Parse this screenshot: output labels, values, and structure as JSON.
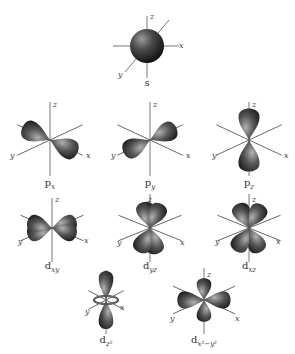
{
  "diagram": {
    "axis_labels": {
      "x": "x",
      "y": "y",
      "z": "z"
    },
    "orbitals": [
      {
        "id": "s",
        "label": "s",
        "sub": "",
        "shape": "sphere"
      },
      {
        "id": "px",
        "label": "p",
        "sub": "x",
        "shape": "dumbbell-x"
      },
      {
        "id": "py",
        "label": "p",
        "sub": "y",
        "shape": "dumbbell-y"
      },
      {
        "id": "pz",
        "label": "p",
        "sub": "z",
        "shape": "dumbbell-z"
      },
      {
        "id": "dxy",
        "label": "d",
        "sub": "xy",
        "shape": "cloverleaf-xy"
      },
      {
        "id": "dyz",
        "label": "d",
        "sub": "yz",
        "shape": "cloverleaf-yz"
      },
      {
        "id": "dxz",
        "label": "d",
        "sub": "xz",
        "shape": "cloverleaf-xz"
      },
      {
        "id": "dz2",
        "label": "d",
        "sub": "z²",
        "shape": "dumbbell-torus"
      },
      {
        "id": "dx2y2",
        "label": "d",
        "sub": "x²−y²",
        "shape": "cloverleaf-axes"
      }
    ],
    "colors": {
      "lobe_dark": "#2a2a2a",
      "lobe_light": "#9a9a9a",
      "axis": "#555555"
    }
  }
}
